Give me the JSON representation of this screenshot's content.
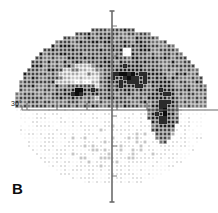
{
  "figure": {
    "panel_label": "B",
    "type": "visual-field-grayscale",
    "axis_label_left": "30°",
    "background_color": "#ffffff",
    "axis_color": "#6b6b6b",
    "ink_color": "#111111"
  },
  "axes": {
    "horizontal": {
      "y_px": 110,
      "x_start_px": 22,
      "x_end_px": 218,
      "tick_positions_px": [
        27,
        57,
        87,
        117,
        147,
        177
      ],
      "tick_length_px": 7
    },
    "vertical": {
      "x_px": 112,
      "y_start_px": 11,
      "y_end_px": 202,
      "tick_positions_px": [
        26,
        56,
        86,
        116,
        146,
        176
      ],
      "tick_length_px": 5
    }
  },
  "chart_data": {
    "type": "heatmap",
    "title": "",
    "subtitle": "",
    "xlabel": "",
    "ylabel": "",
    "legend": [],
    "grid": false,
    "axis_marker": "30°",
    "field_shape": "ellipse",
    "field_center_px": [
      112,
      107
    ],
    "field_radius_x_px": 97,
    "field_radius_y_px": 79,
    "cell_size_px": 4,
    "gray_levels": [
      0,
      1,
      2,
      3,
      4,
      5,
      6,
      7,
      8,
      9
    ],
    "gray_level_hex": [
      "#ffffff",
      "#f2f2f2",
      "#dedede",
      "#c4c4c4",
      "#a8a8a8",
      "#8a8a8a",
      "#6d6d6d",
      "#4e4e4e",
      "#2b2b2b",
      "#0d0d0d"
    ],
    "regions": [
      {
        "name": "superior-field-dense",
        "description": "Dense dark stippling across the entire superior hemifield",
        "bounds_px": [
          18,
          28,
          206,
          108
        ],
        "mean_level": 6
      },
      {
        "name": "inferior-field-sparse",
        "description": "Light fine stippling across the inferior hemifield",
        "bounds_px": [
          22,
          111,
          200,
          188
        ],
        "mean_level": 2
      },
      {
        "name": "superior-nasal-step-pale",
        "description": "Relatively preserved pale wedge inferior-temporal to fixation in superior field",
        "bounds_px": [
          62,
          68,
          104,
          98
        ],
        "mean_level": 3
      },
      {
        "name": "paracentral-scotoma-left",
        "description": "Dense black paracentral scotoma left of fixation",
        "bounds_px": [
          62,
          86,
          96,
          98
        ],
        "mean_level": 9
      },
      {
        "name": "paracentral-scotoma-right",
        "description": "Dense black scotoma arcing above and right of fixation",
        "bounds_px": [
          108,
          62,
          152,
          92
        ],
        "mean_level": 9
      },
      {
        "name": "blind-spot",
        "description": "Dense black blind spot straddling the horizontal meridian temporally",
        "bounds_px": [
          153,
          84,
          174,
          132
        ],
        "mean_level": 9
      },
      {
        "name": "superior-temporal-dark",
        "description": "Dark band superior temporal",
        "bounds_px": [
          148,
          80,
          178,
          104
        ],
        "mean_level": 8
      },
      {
        "name": "small-pale-spot",
        "description": "Tiny pale spot in superior field",
        "bounds_px": [
          124,
          48,
          132,
          56
        ],
        "mean_level": 1
      }
    ],
    "notes": "Grayscale perimetry printout: superior hemifield markedly depressed (dark), inferior hemifield relatively preserved (light), with dense absolute scotomas near fixation and at the physiologic blind spot."
  }
}
